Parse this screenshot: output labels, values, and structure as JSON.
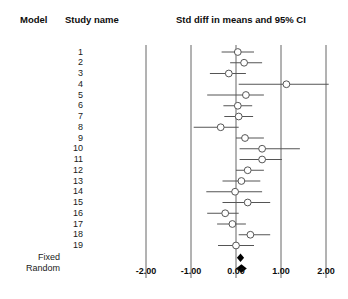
{
  "headers": {
    "model": "Model",
    "study_name": "Study name",
    "axis_title": "Std diff in means and 95% CI"
  },
  "model_labels": {
    "fixed": "Fixed",
    "random": "Random"
  },
  "axis": {
    "tick_labels": [
      "-2.00",
      "-1.00",
      "0.00",
      "1.00",
      "2.00"
    ]
  },
  "colors": {
    "marker_stroke": "#555555",
    "line": "#555555",
    "gridline": "#666666",
    "summary_fill": "#000000",
    "text": "#1a1a1a"
  },
  "chart_data": {
    "type": "scatter",
    "title": "Std diff in means and 95% CI",
    "xlabel": "Std diff in means",
    "ylabel": "Study name",
    "xlim": [
      -2.4,
      2.2
    ],
    "ticks": [
      -2.0,
      -1.0,
      0.0,
      1.0,
      2.0
    ],
    "grid": true,
    "reference_line": 0.0,
    "legend": "none",
    "studies": [
      {
        "name": "1",
        "effect": 0.04,
        "ci_low": -0.32,
        "ci_high": 0.4
      },
      {
        "name": "2",
        "effect": 0.18,
        "ci_low": -0.13,
        "ci_high": 0.58
      },
      {
        "name": "3",
        "effect": -0.16,
        "ci_low": -0.58,
        "ci_high": 0.22
      },
      {
        "name": "4",
        "effect": 1.12,
        "ci_low": 0.06,
        "ci_high": 2.06
      },
      {
        "name": "5",
        "effect": 0.22,
        "ci_low": -0.64,
        "ci_high": 0.62
      },
      {
        "name": "6",
        "effect": 0.04,
        "ci_low": -0.28,
        "ci_high": 0.36
      },
      {
        "name": "7",
        "effect": 0.06,
        "ci_low": -0.26,
        "ci_high": 0.38
      },
      {
        "name": "8",
        "effect": -0.34,
        "ci_low": -0.94,
        "ci_high": 0.06
      },
      {
        "name": "9",
        "effect": 0.2,
        "ci_low": 0.0,
        "ci_high": 0.62
      },
      {
        "name": "10",
        "effect": 0.58,
        "ci_low": 0.08,
        "ci_high": 1.42
      },
      {
        "name": "11",
        "effect": 0.58,
        "ci_low": 0.08,
        "ci_high": 1.02
      },
      {
        "name": "12",
        "effect": 0.26,
        "ci_low": 0.0,
        "ci_high": 0.62
      },
      {
        "name": "13",
        "effect": 0.12,
        "ci_low": -0.3,
        "ci_high": 0.54
      },
      {
        "name": "14",
        "effect": -0.02,
        "ci_low": -0.66,
        "ci_high": 0.58
      },
      {
        "name": "15",
        "effect": 0.26,
        "ci_low": -0.3,
        "ci_high": 0.76
      },
      {
        "name": "16",
        "effect": -0.24,
        "ci_low": -0.64,
        "ci_high": 0.06
      },
      {
        "name": "17",
        "effect": -0.08,
        "ci_low": -0.42,
        "ci_high": 0.22
      },
      {
        "name": "18",
        "effect": 0.32,
        "ci_low": 0.06,
        "ci_high": 0.76
      },
      {
        "name": "19",
        "effect": 0.0,
        "ci_low": -0.4,
        "ci_high": 0.4
      }
    ],
    "summary": [
      {
        "name": "Fixed",
        "effect": 0.1,
        "ci_low": 0.02,
        "ci_high": 0.18
      },
      {
        "name": "Random",
        "effect": 0.12,
        "ci_low": 0.0,
        "ci_high": 0.24
      }
    ]
  }
}
